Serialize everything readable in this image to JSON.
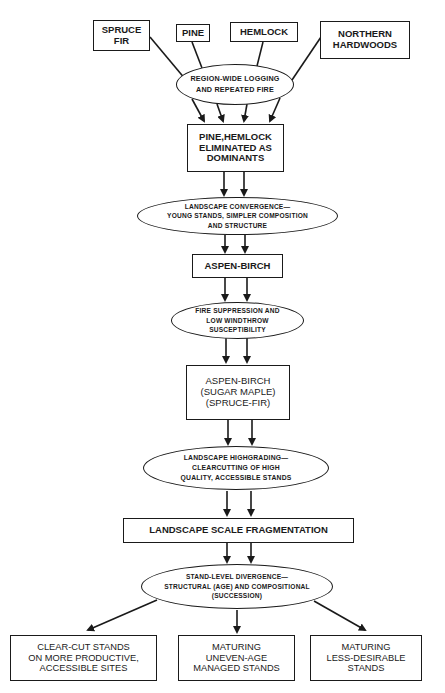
{
  "diagram": {
    "sources": [
      {
        "id": "spruce-fir",
        "label": "SPRUCE\nFIR"
      },
      {
        "id": "pine",
        "label": "PINE"
      },
      {
        "id": "hemlock",
        "label": "HEMLOCK"
      },
      {
        "id": "northern-hardwoods",
        "label": "NORTHERN\nHARDWOODS"
      }
    ],
    "process1": {
      "label": "REGION-WIDE LOGGING\nAND REPEATED FIRE"
    },
    "state1": {
      "label": "PINE,HEMLOCK\nELIMINATED AS\nDOMINANTS"
    },
    "process2": {
      "label": "LANDSCAPE CONVERGENCE—\nYOUNG STANDS, SIMPLER COMPOSITION\nAND STRUCTURE"
    },
    "state2": {
      "label": "ASPEN-BIRCH"
    },
    "process3": {
      "label": "FIRE SUPPRESSION AND\nLOW WINDTHROW\nSUSCEPTIBILITY"
    },
    "state3": {
      "label": "ASPEN-BIRCH\n(SUGAR MAPLE)\n(SPRUCE-FIR)"
    },
    "process4": {
      "label": "LANDSCAPE HIGHGRADING—\nCLEARCUTTING OF HIGH\nQUALITY, ACCESSIBLE STANDS"
    },
    "state4": {
      "label": "LANDSCAPE SCALE FRAGMENTATION"
    },
    "process5": {
      "label": "STAND-LEVEL DIVERGENCE—\nSTRUCTURAL (AGE) AND COMPOSITIONAL\n(SUCCESSION)"
    },
    "outcomes": [
      {
        "id": "clear-cut",
        "label": "CLEAR-CUT STANDS\nON MORE PRODUCTIVE,\nACCESSIBLE SITES"
      },
      {
        "id": "uneven-age",
        "label": "MATURING\nUNEVEN-AGE\nMANAGED STANDS"
      },
      {
        "id": "less-desirable",
        "label": "MATURING\nLESS-DESIRABLE\nSTANDS"
      }
    ]
  }
}
